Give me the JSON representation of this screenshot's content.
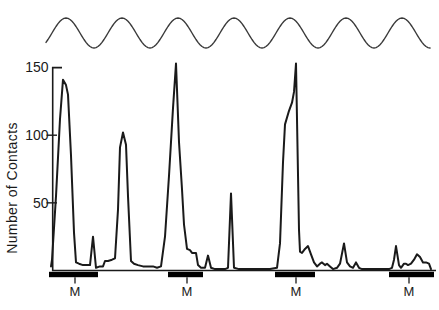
{
  "colors": {
    "background": "#ffffff",
    "line": "#1a1a1a",
    "wave": "#3a3a3a",
    "axis": "#1a1a1a",
    "marker_bar": "#000000",
    "text": "#1a1a1a"
  },
  "chart_data": {
    "type": "line",
    "title": "",
    "xlabel": "",
    "ylabel": "Number of Contacts",
    "yticks": [
      50,
      100,
      150
    ],
    "ylim": [
      0,
      155
    ],
    "x_unit": "figure px (no numeric x scale shown in source)",
    "grid": false,
    "legend": "none",
    "series": [
      {
        "name": "Number of Contacts",
        "points": [
          [
            51,
            3
          ],
          [
            52,
            8
          ],
          [
            56,
            55
          ],
          [
            60,
            112
          ],
          [
            63,
            141
          ],
          [
            66,
            137
          ],
          [
            68,
            130
          ],
          [
            71,
            85
          ],
          [
            74,
            28
          ],
          [
            76,
            6
          ],
          [
            79,
            5
          ],
          [
            83,
            4
          ],
          [
            87,
            4
          ],
          [
            90,
            4
          ],
          [
            93,
            25
          ],
          [
            96,
            2
          ],
          [
            100,
            3
          ],
          [
            103,
            3
          ],
          [
            105,
            7
          ],
          [
            108,
            7
          ],
          [
            112,
            8
          ],
          [
            115,
            9
          ],
          [
            118,
            45
          ],
          [
            120,
            91
          ],
          [
            123,
            102
          ],
          [
            126,
            93
          ],
          [
            128,
            55
          ],
          [
            131,
            7
          ],
          [
            134,
            5
          ],
          [
            138,
            4
          ],
          [
            143,
            3
          ],
          [
            148,
            3
          ],
          [
            153,
            3
          ],
          [
            157,
            2
          ],
          [
            161,
            3
          ],
          [
            165,
            25
          ],
          [
            169,
            70
          ],
          [
            173,
            120
          ],
          [
            176,
            153
          ],
          [
            179,
            95
          ],
          [
            182,
            60
          ],
          [
            184,
            34
          ],
          [
            187,
            16
          ],
          [
            190,
            15
          ],
          [
            192,
            13
          ],
          [
            196,
            13
          ],
          [
            198,
            4
          ],
          [
            201,
            2
          ],
          [
            205,
            2
          ],
          [
            208,
            11
          ],
          [
            211,
            2
          ],
          [
            215,
            1
          ],
          [
            220,
            1
          ],
          [
            225,
            1
          ],
          [
            228,
            2
          ],
          [
            231,
            57
          ],
          [
            234,
            2
          ],
          [
            239,
            1
          ],
          [
            246,
            1
          ],
          [
            254,
            1
          ],
          [
            262,
            1
          ],
          [
            270,
            1
          ],
          [
            277,
            2
          ],
          [
            280,
            20
          ],
          [
            283,
            80
          ],
          [
            285,
            108
          ],
          [
            289,
            118
          ],
          [
            292,
            124
          ],
          [
            294,
            132
          ],
          [
            296,
            153
          ],
          [
            299,
            30
          ],
          [
            300,
            14
          ],
          [
            302,
            13
          ],
          [
            305,
            16
          ],
          [
            308,
            18
          ],
          [
            311,
            12
          ],
          [
            314,
            6
          ],
          [
            317,
            3
          ],
          [
            320,
            5
          ],
          [
            322,
            6
          ],
          [
            325,
            4
          ],
          [
            327,
            5
          ],
          [
            330,
            3
          ],
          [
            333,
            1
          ],
          [
            337,
            2
          ],
          [
            340,
            5
          ],
          [
            344,
            20
          ],
          [
            347,
            6
          ],
          [
            350,
            3
          ],
          [
            353,
            2
          ],
          [
            356,
            6
          ],
          [
            359,
            2
          ],
          [
            362,
            1
          ],
          [
            368,
            1
          ],
          [
            375,
            1
          ],
          [
            382,
            1
          ],
          [
            389,
            1
          ],
          [
            392,
            2
          ],
          [
            394,
            8
          ],
          [
            396,
            18
          ],
          [
            399,
            4
          ],
          [
            401,
            2
          ],
          [
            404,
            5
          ],
          [
            406,
            5
          ],
          [
            408,
            4
          ],
          [
            411,
            5
          ],
          [
            414,
            8
          ],
          [
            417,
            12
          ],
          [
            420,
            10
          ],
          [
            423,
            6
          ],
          [
            426,
            6
          ],
          [
            429,
            5
          ],
          [
            431,
            1
          ]
        ]
      }
    ],
    "moon_wave": {
      "description": "sinusoidal cycle drawn above the plot",
      "start_x": 46,
      "end_x": 430,
      "period": 56,
      "first_crest_x": 66,
      "crest_y": 18,
      "trough_y": 48,
      "n_crests": 7
    },
    "m_markers": [
      {
        "start_x": 49,
        "end_x": 98,
        "tick_x": 75,
        "label": "M"
      },
      {
        "start_x": 168,
        "end_x": 203,
        "tick_x": 187,
        "label": "M"
      },
      {
        "start_x": 275,
        "end_x": 315,
        "tick_x": 296,
        "label": "M"
      },
      {
        "start_x": 389,
        "end_x": 434,
        "tick_x": 409,
        "label": "M"
      }
    ]
  }
}
